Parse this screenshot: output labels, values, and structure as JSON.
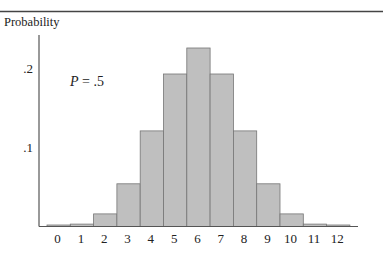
{
  "chart_data": {
    "type": "bar",
    "title": "",
    "ylabel": "Probability",
    "xlabel": "",
    "annotation": "P = .5",
    "annotation_var": "P",
    "annotation_rest": " = .5",
    "categories": [
      "0",
      "1",
      "2",
      "3",
      "4",
      "5",
      "6",
      "7",
      "8",
      "9",
      "10",
      "11",
      "12"
    ],
    "values": [
      0.0002,
      0.003,
      0.016,
      0.054,
      0.121,
      0.193,
      0.226,
      0.193,
      0.121,
      0.054,
      0.016,
      0.003,
      0.0002
    ],
    "yticks": [
      {
        "value": 0.1,
        "label": ".1"
      },
      {
        "value": 0.2,
        "label": ".2"
      }
    ],
    "ylim": [
      0,
      0.24
    ],
    "grid": false,
    "legend": null,
    "colors": {
      "bar_fill": "#bfbfbf",
      "bar_stroke": "#767676",
      "axis": "#555555",
      "rule": "#444444"
    }
  }
}
